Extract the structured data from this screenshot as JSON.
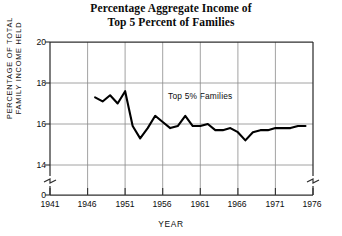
{
  "figure": {
    "title_lines": [
      "Percentage Aggregate Income of",
      "Top 5 Percent of Families"
    ],
    "background_color": "#ffffff",
    "ink_color": "#111111",
    "grid_color": "#8a8a8a",
    "frame_color": "#3b3b3b",
    "line_color": "#000000"
  },
  "axes": {
    "y_caption_lines": [
      "PERCENTAGE OF TOTAL",
      "FAMILY INCOME HELD"
    ],
    "x_caption": "YEAR",
    "y_tick_labels": [
      "20",
      "18",
      "16",
      "14",
      "0"
    ],
    "x_tick_labels": [
      "1941",
      "1946",
      "1951",
      "1956",
      "1961",
      "1966",
      "1971",
      "1976"
    ],
    "y_axis_break": true,
    "x_axis_break": true
  },
  "annotations": {
    "series_label": "Top 5% Families"
  },
  "chart_data": {
    "type": "line",
    "title": "Percentage Aggregate Income of Top 5 Percent of Families",
    "xlabel": "YEAR",
    "ylabel": "PERCENTAGE OF TOTAL FAMILY INCOME HELD",
    "xlim": [
      1941,
      1976
    ],
    "ylim": [
      13.0,
      20.0
    ],
    "y_ticks": [
      14,
      16,
      18,
      20
    ],
    "x_ticks": [
      1941,
      1946,
      1951,
      1956,
      1961,
      1966,
      1971,
      1976
    ],
    "y_axis_zero_break": true,
    "grid": true,
    "legend": "none",
    "series": [
      {
        "name": "Top 5% Families",
        "x": [
          1947,
          1948,
          1949,
          1950,
          1951,
          1952,
          1953,
          1954,
          1955,
          1956,
          1957,
          1958,
          1959,
          1960,
          1961,
          1962,
          1963,
          1964,
          1965,
          1966,
          1967,
          1968,
          1969,
          1970,
          1971,
          1972,
          1973,
          1974,
          1975
        ],
        "values": [
          17.3,
          17.1,
          17.4,
          17.0,
          17.6,
          15.9,
          15.3,
          15.8,
          16.4,
          16.1,
          15.8,
          15.9,
          16.4,
          15.9,
          15.9,
          16.0,
          15.7,
          15.7,
          15.8,
          15.6,
          15.2,
          15.6,
          15.7,
          15.7,
          15.8,
          15.8,
          15.8,
          15.9,
          15.9
        ]
      }
    ]
  }
}
